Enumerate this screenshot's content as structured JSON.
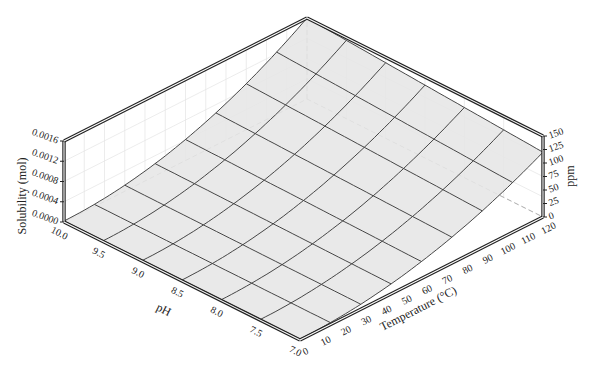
{
  "chart_data": {
    "type": "surface3d",
    "title": "",
    "axes": {
      "x": {
        "label": "Temperature (°C)",
        "range": [
          0,
          120
        ],
        "ticks": [
          0,
          10,
          20,
          30,
          40,
          50,
          60,
          70,
          80,
          90,
          100,
          110,
          120
        ]
      },
      "y": {
        "label": "pH",
        "range": [
          7.0,
          10.0
        ],
        "ticks": [
          "7.0",
          "7.5",
          "8.0",
          "8.5",
          "9.0",
          "9.5",
          "10.0"
        ]
      },
      "z_left": {
        "label": "Solubility (mol)",
        "range": [
          0,
          0.0016
        ],
        "ticks": [
          "0.0000",
          "0.0004",
          "0.0008",
          "0.0012",
          "0.0016"
        ]
      },
      "z_right": {
        "label": "ppm",
        "range": [
          0,
          150
        ],
        "ticks": [
          "0",
          "25",
          "50",
          "75",
          "100",
          "125",
          "150"
        ]
      }
    },
    "grid": {
      "temperature_divisions": 8,
      "ph_divisions": 6
    },
    "surface_corners": [
      {
        "pH": 7.0,
        "T": 0,
        "solubility_mol": 2e-05
      },
      {
        "pH": 10.0,
        "T": 0,
        "solubility_mol": 2e-05
      },
      {
        "pH": 7.0,
        "T": 120,
        "solubility_mol": 0.00128
      },
      {
        "pH": 10.0,
        "T": 120,
        "solubility_mol": 0.0016
      }
    ],
    "model": {
      "T_exponent": 2.0,
      "base_mol": 2e-05
    },
    "colors": {
      "surface": "#e6e6e6",
      "mesh": "#333333",
      "frame": "#222222",
      "hidden": "#aaaaaa"
    }
  }
}
